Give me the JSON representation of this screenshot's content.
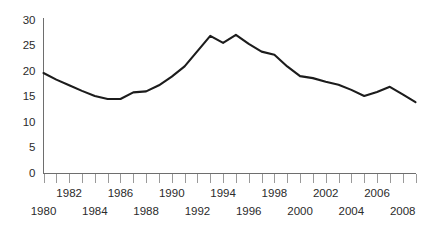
{
  "chart_data": {
    "type": "line",
    "title": "",
    "subtitle": "",
    "xlabel": "",
    "ylabel": "",
    "grid": false,
    "legend": false,
    "legend_position": "none",
    "xlim": [
      1980,
      2009
    ],
    "ylim": [
      0,
      30
    ],
    "y_ticks": [
      0,
      5,
      10,
      15,
      20,
      25,
      30
    ],
    "y_tick_labels": [
      "0",
      "5",
      "10",
      "15",
      "20",
      "25",
      "30"
    ],
    "x_ticks": [
      1980,
      1981,
      1982,
      1983,
      1984,
      1985,
      1986,
      1987,
      1988,
      1989,
      1990,
      1991,
      1992,
      1993,
      1994,
      1995,
      1996,
      1997,
      1998,
      1999,
      2000,
      2001,
      2002,
      2003,
      2004,
      2005,
      2006,
      2007,
      2008,
      2009
    ],
    "x_tick_labels_upper": [
      {
        "value": 1982,
        "label": "1982"
      },
      {
        "value": 1986,
        "label": "1986"
      },
      {
        "value": 1990,
        "label": "1990"
      },
      {
        "value": 1994,
        "label": "1994"
      },
      {
        "value": 1998,
        "label": "1998"
      },
      {
        "value": 2002,
        "label": "2002"
      },
      {
        "value": 2006,
        "label": "2006"
      }
    ],
    "x_tick_labels_lower": [
      {
        "value": 1980,
        "label": "1980"
      },
      {
        "value": 1984,
        "label": "1984"
      },
      {
        "value": 1988,
        "label": "1988"
      },
      {
        "value": 1992,
        "label": "1992"
      },
      {
        "value": 1996,
        "label": "1996"
      },
      {
        "value": 2000,
        "label": "2000"
      },
      {
        "value": 2004,
        "label": "2004"
      },
      {
        "value": 2008,
        "label": "2008"
      }
    ],
    "x": [
      1980,
      1981,
      1982,
      1983,
      1984,
      1985,
      1986,
      1987,
      1988,
      1989,
      1990,
      1991,
      1992,
      1993,
      1994,
      1995,
      1996,
      1997,
      1998,
      1999,
      2000,
      2001,
      2002,
      2003,
      2004,
      2005,
      2006,
      2007,
      2008,
      2009
    ],
    "values": [
      19.7,
      18.4,
      17.3,
      16.2,
      15.2,
      14.6,
      14.6,
      15.9,
      16.1,
      17.3,
      19.0,
      21.0,
      24.0,
      27.0,
      25.6,
      27.2,
      25.4,
      23.9,
      23.3,
      21.0,
      19.1,
      18.7,
      18.0,
      17.4,
      16.4,
      15.2,
      16.0,
      17.0,
      15.5,
      14.0
    ],
    "line_color": "#1c1c1c",
    "axis_color": "#6e6e6e"
  }
}
